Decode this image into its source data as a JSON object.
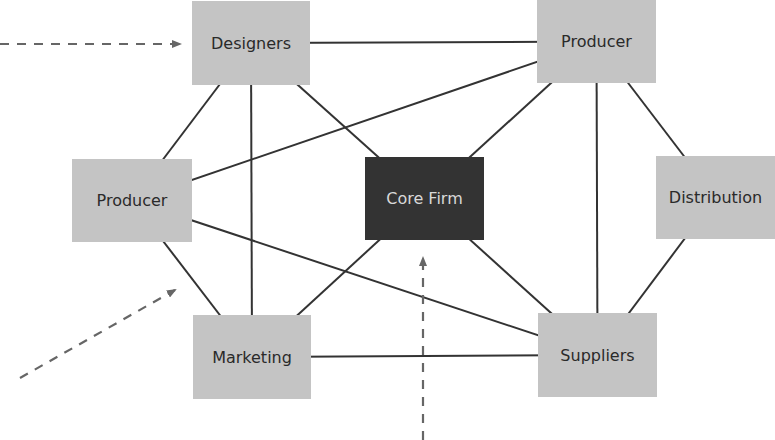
{
  "diagram": {
    "type": "network",
    "colors": {
      "node_fill": "#c4c4c4",
      "core_fill": "#333333",
      "core_text": "#d8d8d8",
      "node_text": "#2a2a2a",
      "edge": "#333333",
      "arrow": "#666666"
    },
    "nodes": [
      {
        "id": "designers",
        "label": "Designers",
        "x": 192,
        "y": 1,
        "w": 118,
        "h": 84,
        "style": "light"
      },
      {
        "id": "producer_top",
        "label": "Producer",
        "x": 537,
        "y": 0,
        "w": 119,
        "h": 83,
        "style": "light"
      },
      {
        "id": "producer_left",
        "label": "Producer",
        "x": 72,
        "y": 159,
        "w": 120,
        "h": 83,
        "style": "light"
      },
      {
        "id": "core_firm",
        "label": "Core Firm",
        "x": 365,
        "y": 157,
        "w": 119,
        "h": 83,
        "style": "dark"
      },
      {
        "id": "distribution",
        "label": "Distribution",
        "x": 656,
        "y": 156,
        "w": 119,
        "h": 83,
        "style": "light"
      },
      {
        "id": "marketing",
        "label": "Marketing",
        "x": 193,
        "y": 315,
        "w": 118,
        "h": 84,
        "style": "light"
      },
      {
        "id": "suppliers",
        "label": "Suppliers",
        "x": 538,
        "y": 313,
        "w": 119,
        "h": 84,
        "style": "light"
      }
    ],
    "edges": [
      {
        "from": "designers",
        "to": "producer_top"
      },
      {
        "from": "designers",
        "to": "producer_left"
      },
      {
        "from": "designers",
        "to": "marketing"
      },
      {
        "from": "designers",
        "to": "core_firm"
      },
      {
        "from": "producer_top",
        "to": "producer_left"
      },
      {
        "from": "producer_top",
        "to": "core_firm"
      },
      {
        "from": "producer_top",
        "to": "suppliers"
      },
      {
        "from": "producer_top",
        "to": "distribution"
      },
      {
        "from": "producer_left",
        "to": "marketing"
      },
      {
        "from": "producer_left",
        "to": "suppliers"
      },
      {
        "from": "core_firm",
        "to": "marketing"
      },
      {
        "from": "core_firm",
        "to": "suppliers"
      },
      {
        "from": "marketing",
        "to": "suppliers"
      },
      {
        "from": "distribution",
        "to": "suppliers"
      }
    ],
    "dashed_arrows": [
      {
        "name": "arrow-into-designers",
        "x1": 0,
        "y1": 44,
        "x2": 180,
        "y2": 44
      },
      {
        "name": "arrow-into-network-left",
        "x1": 20,
        "y1": 378,
        "x2": 175,
        "y2": 290
      },
      {
        "name": "arrow-into-core-firm",
        "x1": 423,
        "y1": 440,
        "x2": 423,
        "y2": 258
      }
    ]
  }
}
